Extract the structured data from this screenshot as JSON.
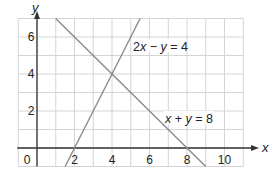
{
  "chart_data": {
    "type": "line",
    "title": "",
    "xlabel": "x",
    "ylabel": "y",
    "xlim": [
      -1,
      11
    ],
    "ylim": [
      -1,
      7
    ],
    "grid": true,
    "x_ticks": [
      0,
      2,
      4,
      6,
      8,
      10
    ],
    "y_ticks": [
      2,
      4,
      6
    ],
    "x_tick_labels": [
      "0",
      "2",
      "4",
      "6",
      "8",
      "10"
    ],
    "y_tick_labels": [
      "2",
      "4",
      "6"
    ],
    "series": [
      {
        "name": "x + y = 8",
        "equation": "x + y = 8",
        "points": [
          [
            1,
            7
          ],
          [
            9,
            -1
          ]
        ],
        "label_pos": [
          7,
          1.6
        ]
      },
      {
        "name": "2x - y = 4",
        "equation": "2x − y = 4",
        "points": [
          [
            1.5,
            -1
          ],
          [
            5.5,
            7
          ]
        ],
        "label_pos": [
          5.2,
          5.5
        ]
      }
    ],
    "intersection": [
      4,
      4
    ],
    "colors": {
      "grid": "#d4d4d4",
      "axes": "#333333",
      "lines": "#8a8a8a",
      "text": "#222222"
    }
  },
  "labels": {
    "x_axis": "x",
    "y_axis": "y",
    "origin": "0",
    "line1": "x + y = 8",
    "line2": "2x − y = 4"
  }
}
